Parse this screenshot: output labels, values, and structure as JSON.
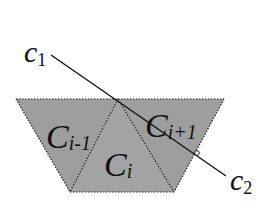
{
  "diagram": {
    "title": "",
    "colors": {
      "background": "#ffffff",
      "triangle_fill": "#9e9e9e",
      "edge": "#222222",
      "line": "#111111"
    },
    "triangles": [
      {
        "id": "C_i-1",
        "label_main": "C",
        "label_sub": "i-1",
        "points": [
          [
            16,
            99
          ],
          [
            118,
            99
          ],
          [
            70,
            192
          ]
        ]
      },
      {
        "id": "C_i",
        "label_main": "C",
        "label_sub": "i",
        "points": [
          [
            118,
            99
          ],
          [
            174,
            192
          ],
          [
            70,
            192
          ]
        ]
      },
      {
        "id": "C_i+1",
        "label_main": "C",
        "label_sub": "i+1",
        "points": [
          [
            118,
            99
          ],
          [
            224,
            99
          ],
          [
            174,
            192
          ]
        ]
      }
    ],
    "segment": {
      "start": {
        "label_main": "c",
        "label_sub": "1",
        "x": 51,
        "y": 55
      },
      "end": {
        "label_main": "c",
        "label_sub": "2",
        "x": 226,
        "y": 176
      },
      "marker": {
        "x": 197,
        "y": 153
      }
    },
    "labels": {
      "c1_main": "c",
      "c1_sub": "1",
      "c2_main": "c",
      "c2_sub": "2",
      "ci_minus_1_main": "C",
      "ci_minus_1_sub": "i-1",
      "ci_main": "C",
      "ci_sub": "i",
      "ci_plus_1_main": "C",
      "ci_plus_1_sub": "i+1"
    }
  }
}
